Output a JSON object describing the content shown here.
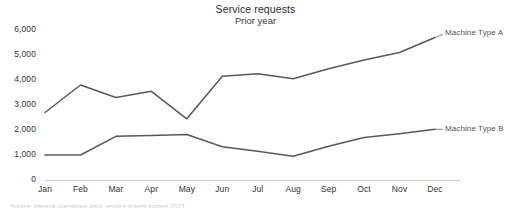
{
  "chart_data": {
    "type": "line",
    "title": "Service requests",
    "subtitle": "Prior year",
    "xlabel": "",
    "ylabel": "",
    "categories": [
      "Jan",
      "Feb",
      "Mar",
      "Apr",
      "May",
      "Jun",
      "Jul",
      "Aug",
      "Sep",
      "Oct",
      "Nov",
      "Dec"
    ],
    "ylim": [
      0,
      6000
    ],
    "ytick_labels": [
      "6,000",
      "5,000",
      "4,000",
      "3,000",
      "2,000",
      "1,000",
      "0"
    ],
    "ytick_values": [
      6000,
      5000,
      4000,
      3000,
      2000,
      1000,
      0
    ],
    "grid": false,
    "legend_position": "end-of-line-direct-labels",
    "series": [
      {
        "name": "Machine Type A",
        "color": "#595959",
        "values": [
          2700,
          3800,
          3300,
          3550,
          2450,
          4150,
          4250,
          4050,
          4450,
          4800,
          5100,
          5700
        ]
      },
      {
        "name": "Machine Type B",
        "color": "#595959",
        "values": [
          1000,
          1000,
          1750,
          1780,
          1820,
          1330,
          1150,
          950,
          1350,
          1700,
          1850,
          2030
        ]
      }
    ]
  },
  "footer": {
    "caption": "Source: internal operations data, service tickets logged 2023"
  },
  "colors": {
    "line": "#595959",
    "axis": "#cccccc",
    "text": "#333333",
    "title": "#2b2b2b",
    "label": "#555555"
  }
}
